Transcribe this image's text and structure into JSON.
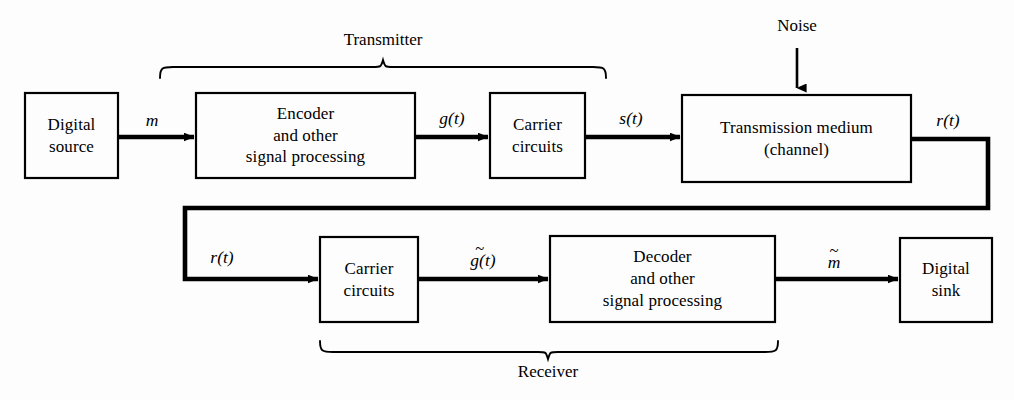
{
  "figure": {
    "background_color": "#fdfdfd",
    "line_color": "#000000"
  },
  "blocks": [
    {
      "id": "digital-source",
      "lines": [
        "Digital",
        "source"
      ],
      "x": 25,
      "y": 93,
      "w": 93,
      "h": 85
    },
    {
      "id": "encoder",
      "lines": [
        "Encoder",
        "and other",
        "signal processing"
      ],
      "x": 196,
      "y": 93,
      "w": 219,
      "h": 85
    },
    {
      "id": "carrier-circuits-tx",
      "lines": [
        "Carrier",
        "circuits"
      ],
      "x": 490,
      "y": 93,
      "w": 95,
      "h": 85
    },
    {
      "id": "transmission-medium",
      "lines": [
        "Transmission medium",
        "(channel)"
      ],
      "x": 682,
      "y": 95,
      "w": 229,
      "h": 87
    },
    {
      "id": "carrier-circuits-rx",
      "lines": [
        "Carrier",
        "circuits"
      ],
      "x": 320,
      "y": 237,
      "w": 98,
      "h": 85
    },
    {
      "id": "decoder",
      "lines": [
        "Decoder",
        "and other",
        "signal processing"
      ],
      "x": 550,
      "y": 236,
      "w": 225,
      "h": 86
    },
    {
      "id": "digital-sink",
      "lines": [
        "Digital",
        "sink"
      ],
      "x": 900,
      "y": 238,
      "w": 92,
      "h": 84
    }
  ],
  "signal_labels": [
    {
      "id": "signal-m",
      "base": "m",
      "tilde": false,
      "cx": 152,
      "y": 110
    },
    {
      "id": "signal-g-t",
      "base": "g(t)",
      "tilde": false,
      "cx": 452,
      "y": 108
    },
    {
      "id": "signal-s-t",
      "base": "s(t)",
      "tilde": false,
      "cx": 631,
      "y": 108
    },
    {
      "id": "signal-r-t-top",
      "base": "r(t)",
      "tilde": false,
      "cx": 948,
      "y": 110
    },
    {
      "id": "signal-r-t-fb",
      "base": "r(t)",
      "tilde": false,
      "cx": 222,
      "y": 247
    },
    {
      "id": "signal-g-tilde",
      "base": "g(t)",
      "tilde": true,
      "cx": 483,
      "y": 250
    },
    {
      "id": "signal-m-tilde",
      "base": "m",
      "tilde": true,
      "cx": 834,
      "y": 252
    }
  ],
  "group_labels": [
    {
      "id": "transmitter-label",
      "text": "Transmitter",
      "cx": 383,
      "y": 30
    },
    {
      "id": "receiver-label",
      "text": "Receiver",
      "cx": 548,
      "y": 362
    }
  ],
  "noise": {
    "label": "Noise",
    "label_cx": 797,
    "label_y": 16,
    "arrow_x": 797,
    "arrow_y_start": 48,
    "arrow_y_end": 94
  },
  "braces": [
    {
      "id": "transmitter-brace",
      "x_left": 160,
      "x_right": 606,
      "x_tip": 383,
      "y_base": 78,
      "y_tip": 66,
      "direction": "up"
    },
    {
      "id": "receiver-brace",
      "x_left": 320,
      "x_right": 778,
      "x_tip": 548,
      "y_base": 341,
      "y_tip": 353,
      "direction": "down"
    }
  ],
  "connections": [
    {
      "id": "conn-source-to-encoder",
      "from": "digital-source",
      "to": "encoder",
      "kind": "straight-arrow"
    },
    {
      "id": "conn-encoder-to-tx-carr",
      "from": "encoder",
      "to": "carrier-circuits-tx",
      "kind": "straight-arrow"
    },
    {
      "id": "conn-tx-carr-to-medium",
      "from": "carrier-circuits-tx",
      "to": "transmission-medium",
      "kind": "straight-arrow"
    },
    {
      "id": "conn-medium-feedback",
      "from": "transmission-medium",
      "to": "carrier-circuits-rx",
      "kind": "routed-arrow"
    },
    {
      "id": "conn-rx-carr-to-decoder",
      "from": "carrier-circuits-rx",
      "to": "decoder",
      "kind": "straight-arrow"
    },
    {
      "id": "conn-decoder-to-sink",
      "from": "decoder",
      "to": "digital-sink",
      "kind": "straight-arrow"
    },
    {
      "id": "conn-noise-to-medium",
      "from": "noise",
      "to": "transmission-medium",
      "kind": "straight-arrow"
    }
  ]
}
